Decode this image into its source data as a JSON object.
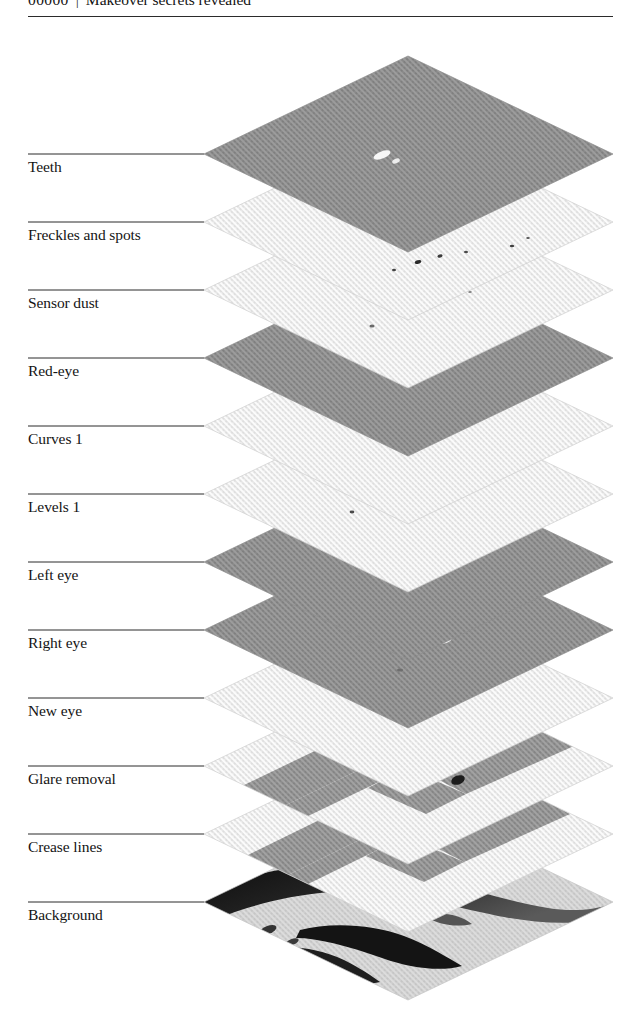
{
  "running_head": {
    "folio": "00000",
    "separator": "|",
    "title": "Makeover secrets revealed"
  },
  "figure": {
    "type": "exploded-layer-stack",
    "caption": "",
    "layers": [
      {
        "label": "Teeth",
        "tone": "dark",
        "content": "highlight-speck"
      },
      {
        "label": "Freckles and spots",
        "tone": "light",
        "content": "small-specks"
      },
      {
        "label": "Sensor dust",
        "tone": "light",
        "content": "scattered-dust"
      },
      {
        "label": "Red-eye",
        "tone": "dark",
        "content": "plain"
      },
      {
        "label": "Curves 1",
        "tone": "light",
        "content": "plain"
      },
      {
        "label": "Levels 1",
        "tone": "light",
        "content": "plain"
      },
      {
        "label": "Left eye",
        "tone": "dark",
        "content": "eye-speck"
      },
      {
        "label": "Right eye",
        "tone": "dark",
        "content": "eye-speck"
      },
      {
        "label": "New eye",
        "tone": "light",
        "content": "plain"
      },
      {
        "label": "Glare removal",
        "tone": "light",
        "content": "dark-chevron"
      },
      {
        "label": "Crease lines",
        "tone": "light",
        "content": "dark-chevron"
      },
      {
        "label": "Background",
        "tone": "photo",
        "content": "portrait-photo"
      }
    ],
    "colors": {
      "dark_plane": "#989898",
      "light_plane": "#f0f0f0",
      "photo_plane": "#d8d8d8",
      "chevron": "#9a9a9a",
      "rule": "#2b2b2b",
      "leader": "#2b2b2b"
    }
  }
}
